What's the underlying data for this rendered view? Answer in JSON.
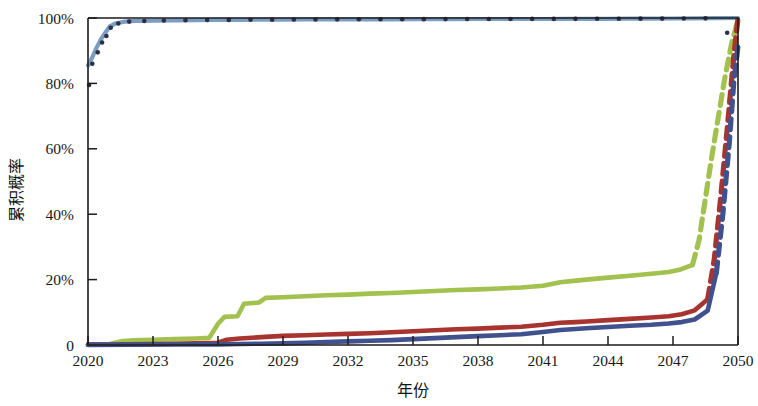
{
  "chart_data": {
    "type": "line",
    "title": "",
    "xlabel": "年份",
    "ylabel": "累积概率",
    "xlim": [
      2020,
      2050
    ],
    "ylim": [
      0,
      100
    ],
    "grid": false,
    "legend": "none",
    "xticks": [
      "2020",
      "2023",
      "2026",
      "2029",
      "2032",
      "2035",
      "2038",
      "2041",
      "2044",
      "2047",
      "2050"
    ],
    "xtick_values": [
      2020,
      2023,
      2026,
      2029,
      2032,
      2035,
      2038,
      2041,
      2044,
      2047,
      2050
    ],
    "yticks": [
      "0",
      "20%",
      "40%",
      "60%",
      "80%",
      "100%"
    ],
    "ytick_values": [
      0,
      20,
      40,
      60,
      80,
      100
    ],
    "series": [
      {
        "name": "series-light-blue",
        "color": "#7c9dc2",
        "style": "solid-with-markers",
        "marker_color": "#2d2f4a",
        "x": [
          2020.0,
          2020.2,
          2020.4,
          2020.6,
          2020.8,
          2021.0,
          2021.3,
          2021.7,
          2022.2,
          2023.0,
          2024.0,
          2025.0,
          2026.0,
          2027.0,
          2028.0,
          2029.0,
          2030.0,
          2031.0,
          2032.0,
          2033.0,
          2034.0,
          2035.0,
          2036.0,
          2037.0,
          2038.0,
          2039.0,
          2040.0,
          2041.0,
          2042.0,
          2043.0,
          2044.0,
          2045.0,
          2046.0,
          2047.0,
          2048.0,
          2049.0,
          2050.0
        ],
        "values": [
          85.5,
          88.0,
          91.0,
          93.5,
          95.5,
          97.4,
          98.4,
          98.9,
          99.1,
          99.2,
          99.3,
          99.35,
          99.4,
          99.45,
          99.5,
          99.5,
          99.55,
          99.55,
          99.6,
          99.6,
          99.6,
          99.65,
          99.65,
          99.65,
          99.7,
          99.7,
          99.7,
          99.7,
          99.72,
          99.75,
          99.75,
          99.8,
          99.8,
          99.85,
          99.9,
          99.95,
          100.0
        ]
      },
      {
        "name": "series-green",
        "color": "#a2c14f",
        "style": "solid-then-dashed",
        "dash_starts_at": 2047.9,
        "x": [
          2020.0,
          2021.0,
          2021.6,
          2022.0,
          2023.0,
          2024.0,
          2025.0,
          2025.6,
          2026.0,
          2026.3,
          2026.9,
          2027.2,
          2027.9,
          2028.2,
          2029.0,
          2030.0,
          2031.0,
          2032.0,
          2033.0,
          2034.0,
          2035.0,
          2036.0,
          2037.0,
          2038.0,
          2039.0,
          2040.0,
          2041.0,
          2041.8,
          2042.4,
          2043.0,
          2044.0,
          2045.0,
          2046.0,
          2046.8,
          2047.3,
          2047.9,
          2048.2,
          2048.5,
          2048.8,
          2049.1,
          2049.4,
          2049.7,
          2050.0
        ],
        "values": [
          0.2,
          0.3,
          1.2,
          1.4,
          1.6,
          1.8,
          2.0,
          2.2,
          6.5,
          8.6,
          8.8,
          12.6,
          13.0,
          14.4,
          14.6,
          14.9,
          15.2,
          15.4,
          15.7,
          15.9,
          16.2,
          16.5,
          16.8,
          17.0,
          17.3,
          17.6,
          18.1,
          19.2,
          19.6,
          20.0,
          20.6,
          21.2,
          21.8,
          22.3,
          23.0,
          24.5,
          32.0,
          45.0,
          58.0,
          70.0,
          82.0,
          92.0,
          99.5
        ]
      },
      {
        "name": "series-red",
        "color": "#a8342f",
        "style": "solid-then-dashed",
        "dash_starts_at": 2048.6,
        "x": [
          2020.0,
          2021.0,
          2022.0,
          2023.0,
          2024.0,
          2025.0,
          2026.0,
          2026.4,
          2027.0,
          2028.0,
          2029.0,
          2030.0,
          2031.0,
          2032.0,
          2033.0,
          2034.0,
          2035.0,
          2036.0,
          2037.0,
          2038.0,
          2039.0,
          2040.0,
          2041.0,
          2041.8,
          2042.5,
          2043.0,
          2044.0,
          2045.0,
          2046.0,
          2046.8,
          2047.4,
          2048.0,
          2048.6,
          2048.9,
          2049.2,
          2049.5,
          2049.8,
          2050.0
        ],
        "values": [
          0.1,
          0.15,
          0.2,
          0.3,
          0.4,
          0.5,
          0.7,
          1.6,
          2.0,
          2.4,
          2.8,
          3.0,
          3.2,
          3.4,
          3.6,
          3.9,
          4.2,
          4.5,
          4.8,
          5.0,
          5.3,
          5.6,
          6.2,
          6.8,
          7.0,
          7.2,
          7.6,
          8.0,
          8.4,
          8.8,
          9.4,
          10.6,
          14.0,
          26.0,
          45.0,
          66.0,
          88.0,
          100.0
        ]
      },
      {
        "name": "series-dark-blue",
        "color": "#40518d",
        "style": "solid-then-dashed",
        "dash_starts_at": 2048.9,
        "x": [
          2020.0,
          2022.0,
          2024.0,
          2026.0,
          2027.0,
          2028.0,
          2029.0,
          2030.0,
          2031.0,
          2032.0,
          2033.0,
          2034.0,
          2035.0,
          2036.0,
          2037.0,
          2038.0,
          2039.0,
          2040.0,
          2041.0,
          2041.8,
          2042.5,
          2043.0,
          2044.0,
          2045.0,
          2046.0,
          2046.8,
          2047.4,
          2048.0,
          2048.6,
          2049.0,
          2049.3,
          2049.6,
          2049.8,
          2050.0
        ],
        "values": [
          0.05,
          0.1,
          0.15,
          0.2,
          0.3,
          0.4,
          0.5,
          0.7,
          0.9,
          1.1,
          1.3,
          1.5,
          1.8,
          2.1,
          2.4,
          2.7,
          3.0,
          3.3,
          4.0,
          4.6,
          4.9,
          5.1,
          5.5,
          5.9,
          6.2,
          6.6,
          7.0,
          7.8,
          10.5,
          22.0,
          40.0,
          62.0,
          80.0,
          91.5
        ]
      }
    ],
    "scatter_markers": {
      "name": "early-observation-dots",
      "color": "#2d2f4a",
      "x": [
        2020.05,
        2020.2,
        2020.45,
        2020.65,
        2020.85,
        2021.05,
        2021.4,
        2021.9,
        2022.6,
        2023.5,
        2024.5,
        2025.5,
        2026.5,
        2027.5,
        2028.5,
        2029.5,
        2030.5,
        2031.5,
        2032.5,
        2033.5,
        2034.5,
        2035.5,
        2036.5,
        2037.5,
        2038.5,
        2039.5,
        2040.5,
        2041.5,
        2042.5,
        2043.5,
        2044.5,
        2045.5,
        2046.5,
        2047.5,
        2048.5,
        2049.5
      ],
      "values": [
        79.5,
        86.0,
        89.5,
        92.5,
        94.5,
        97.0,
        98.3,
        98.9,
        99.1,
        99.25,
        99.3,
        99.4,
        99.42,
        99.48,
        99.5,
        99.52,
        99.55,
        99.58,
        99.6,
        99.6,
        99.62,
        99.65,
        99.66,
        99.68,
        99.7,
        99.7,
        99.72,
        99.72,
        99.74,
        99.76,
        99.78,
        99.8,
        99.82,
        99.86,
        99.9,
        95.5
      ]
    }
  }
}
